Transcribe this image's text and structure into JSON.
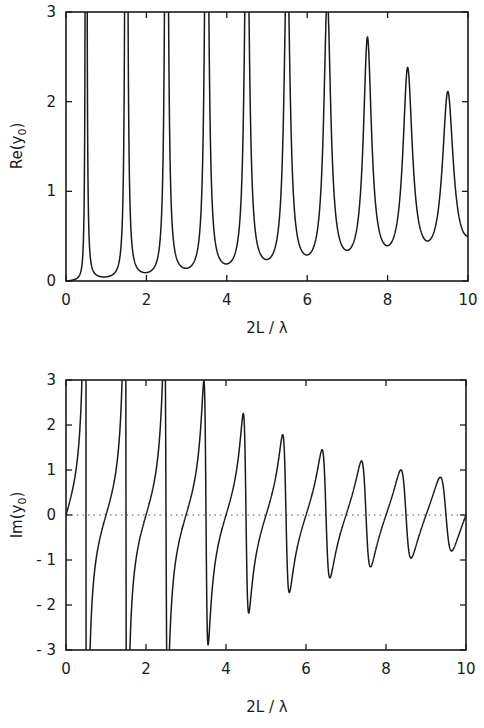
{
  "chart_data": [
    {
      "type": "line",
      "panel": "top",
      "title": "",
      "xlabel": "2L / λ",
      "ylabel": "Re(y0)",
      "xlim": [
        0,
        10
      ],
      "ylim": [
        0,
        3
      ],
      "x_ticks": [
        "0",
        "2",
        "4",
        "6",
        "8",
        "10"
      ],
      "y_ticks": [
        "0",
        "1",
        "2",
        "3"
      ],
      "grid": false,
      "series": [
        {
          "name": "Re(y0)",
          "description": "Resonant peaks at half-integer 2L/λ; first five peaks exceed axis (clipped at 3), decaying peaks thereafter; minima at integer values rising with 2L/λ",
          "peaks": [
            {
              "x": 0.5,
              "y": ">3"
            },
            {
              "x": 1.5,
              "y": ">3"
            },
            {
              "x": 2.5,
              "y": ">3"
            },
            {
              "x": 3.5,
              "y": ">3"
            },
            {
              "x": 4.5,
              "y": ">3"
            },
            {
              "x": 5.5,
              "y": ">3"
            },
            {
              "x": 6.5,
              "y": 2.8
            },
            {
              "x": 7.5,
              "y": 2.45
            },
            {
              "x": 8.5,
              "y": 2.2
            },
            {
              "x": 9.5,
              "y": 2.0
            }
          ],
          "minima": [
            {
              "x": 0.0,
              "y": 0.0
            },
            {
              "x": 1.0,
              "y": 0.07
            },
            {
              "x": 2.0,
              "y": 0.12
            },
            {
              "x": 3.0,
              "y": 0.17
            },
            {
              "x": 4.0,
              "y": 0.23
            },
            {
              "x": 5.0,
              "y": 0.28
            },
            {
              "x": 6.0,
              "y": 0.34
            },
            {
              "x": 7.0,
              "y": 0.38
            },
            {
              "x": 8.0,
              "y": 0.43
            },
            {
              "x": 9.0,
              "y": 0.46
            }
          ],
          "end_value": {
            "x": 10,
            "y": 0.5
          }
        }
      ]
    },
    {
      "type": "line",
      "panel": "bottom",
      "title": "",
      "xlabel": "2L / λ",
      "ylabel": "Im(y0)",
      "xlim": [
        0,
        10
      ],
      "ylim": [
        -3,
        3
      ],
      "x_ticks": [
        "0",
        "2",
        "4",
        "6",
        "8",
        "10"
      ],
      "y_ticks": [
        "-3",
        "-2",
        "-1",
        "0",
        "1",
        "2",
        "3"
      ],
      "grid": false,
      "reference_line": {
        "y": 0,
        "style": "dotted"
      },
      "series": [
        {
          "name": "Im(y0)",
          "description": "Dispersive swings around each half-integer resonance; first three swings exceed ±3 (clipped), then decaying maxima/minima",
          "extrema": [
            {
              "x": 3.45,
              "y": 2.5
            },
            {
              "x": 3.6,
              "y": -2.45
            },
            {
              "x": 4.45,
              "y": 1.9
            },
            {
              "x": 4.6,
              "y": -1.85
            },
            {
              "x": 5.45,
              "y": 1.5
            },
            {
              "x": 5.6,
              "y": -1.5
            },
            {
              "x": 6.4,
              "y": 1.22
            },
            {
              "x": 6.6,
              "y": -1.22
            },
            {
              "x": 7.4,
              "y": 1.02
            },
            {
              "x": 7.6,
              "y": -1.02
            },
            {
              "x": 8.4,
              "y": 0.87
            },
            {
              "x": 8.6,
              "y": -0.9
            },
            {
              "x": 9.4,
              "y": 0.75
            },
            {
              "x": 9.6,
              "y": -0.75
            }
          ],
          "zero_crossings_rising": [
            0.0,
            1.0,
            2.0,
            3.0,
            4.0,
            5.0,
            6.0,
            7.0,
            8.0,
            9.0,
            10.0
          ],
          "end_value": {
            "x": 10,
            "y": 0.0
          }
        }
      ]
    }
  ],
  "labels": {
    "top_ylabel": "Re(y",
    "top_ylabel_sub": "0",
    "top_ylabel_close": ")",
    "bottom_ylabel": "Im(y",
    "bottom_ylabel_sub": "0",
    "bottom_ylabel_close": ")",
    "top_xlabel": "2L / λ",
    "bottom_xlabel": "2L / λ"
  }
}
